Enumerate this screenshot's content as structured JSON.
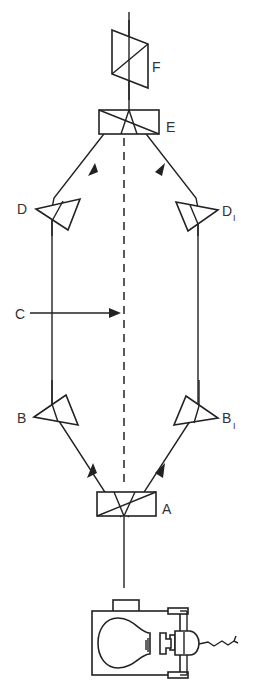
{
  "diagram": {
    "type": "optical-interferometer-schematic",
    "labels": {
      "A": "A",
      "B": "B",
      "B1_main": "B",
      "B1_sub": "I",
      "C": "C",
      "D": "D",
      "D1_main": "D",
      "D1_sub": "I",
      "E": "E",
      "F": "F"
    },
    "components": [
      {
        "id": "lamp",
        "name": "light source (lamp housing with bulb)"
      },
      {
        "id": "A",
        "name": "beam-splitting prism (polarizer)"
      },
      {
        "id": "B",
        "name": "prism, left path lower"
      },
      {
        "id": "B1",
        "name": "prism, right path lower"
      },
      {
        "id": "C",
        "name": "central axis pointer"
      },
      {
        "id": "D",
        "name": "prism, left path upper"
      },
      {
        "id": "D1",
        "name": "prism, right path upper"
      },
      {
        "id": "E",
        "name": "beam-combining prism"
      },
      {
        "id": "F",
        "name": "analyzer prism"
      }
    ],
    "colors": {
      "ink": "#222222",
      "background": "#ffffff"
    }
  }
}
